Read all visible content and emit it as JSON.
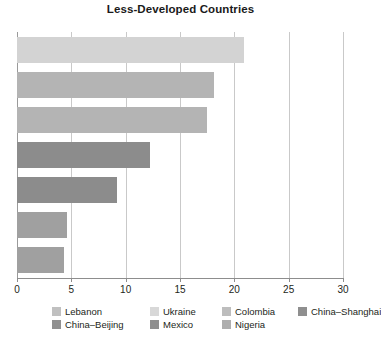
{
  "chart": {
    "title": "Less-Developed Countries"
  },
  "chart_data": {
    "type": "bar",
    "orientation": "horizontal",
    "title": "Less-Developed Countries",
    "xlabel": "",
    "ylabel": "",
    "xlim": [
      0,
      30
    ],
    "xticks": [
      0,
      5,
      10,
      15,
      20,
      25,
      30
    ],
    "xtick_labels": [
      "0",
      "5",
      "10",
      "15",
      "20",
      "25",
      "30"
    ],
    "grid": true,
    "grid_axis": "x",
    "legend_position": "bottom",
    "categories": [
      "Lebanon",
      "Ukraine",
      "Colombia",
      "China–Shanghai",
      "China–Beijing",
      "Mexico",
      "Nigeria"
    ],
    "values": [
      20.9,
      18.1,
      17.5,
      12.2,
      9.2,
      4.6,
      4.3
    ],
    "colors": [
      "#d3d3d3",
      "#b4b4b4",
      "#b4b4b4",
      "#8c8c8c",
      "#8c8c8c",
      "#a0a0a0",
      "#a0a0a0"
    ],
    "bars": [
      {
        "label": "Lebanon",
        "value": 20.9,
        "color": "#d3d3d3"
      },
      {
        "label": "Ukraine",
        "value": 18.1,
        "color": "#b4b4b4"
      },
      {
        "label": "Colombia",
        "value": 17.5,
        "color": "#b4b4b4"
      },
      {
        "label": "China–Shanghai",
        "value": 12.2,
        "color": "#8c8c8c"
      },
      {
        "label": "China–Beijing",
        "value": 9.2,
        "color": "#8c8c8c"
      },
      {
        "label": "Mexico",
        "value": 4.6,
        "color": "#a0a0a0"
      },
      {
        "label": "Nigeria",
        "value": 4.3,
        "color": "#a0a0a0"
      }
    ],
    "legend": [
      {
        "label": "Lebanon",
        "color": "#c0c0c0"
      },
      {
        "label": "Ukraine",
        "color": "#d8d8d8"
      },
      {
        "label": "Colombia",
        "color": "#bdbdbd"
      },
      {
        "label": "China–Shanghai",
        "color": "#8f8f8f"
      },
      {
        "label": "China–Beijing",
        "color": "#909090"
      },
      {
        "label": "Mexico",
        "color": "#8f8f8f"
      },
      {
        "label": "Nigeria",
        "color": "#aeaeae"
      }
    ]
  }
}
